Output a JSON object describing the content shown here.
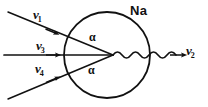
{
  "figure": {
    "kind": "physics-interaction-diagram",
    "background_color": "#ffffff",
    "ink_color": "#111111"
  },
  "atom": {
    "label": "Na",
    "shape": "circle",
    "center_x": 107,
    "center_y": 55,
    "radius": 43
  },
  "incoming_beams": [
    {
      "id": "nu1",
      "symbol": "ν",
      "subscript": "1",
      "direction": "down-right",
      "start": [
        8,
        12
      ],
      "end": [
        113,
        55
      ],
      "arrowhead_at": [
        52,
        33
      ]
    },
    {
      "id": "nu3",
      "symbol": "ν",
      "subscript": "3",
      "direction": "horizontal-right",
      "start": [
        4,
        55
      ],
      "end": [
        113,
        55
      ],
      "arrowhead_at": [
        56,
        55
      ]
    },
    {
      "id": "nu4",
      "symbol": "ν",
      "subscript": "4",
      "direction": "up-right",
      "start": [
        8,
        99
      ],
      "end": [
        113,
        55
      ],
      "arrowhead_at": [
        55,
        79
      ]
    }
  ],
  "outgoing_beam": {
    "id": "nu2",
    "symbol": "ν",
    "subscript": "2",
    "style": "wavy",
    "start": [
      113,
      55
    ],
    "end": [
      184,
      55
    ],
    "arrowhead_at": [
      184,
      55
    ]
  },
  "angles": [
    {
      "id": "alpha-top",
      "label": "α",
      "between": [
        "nu1",
        "nu3"
      ]
    },
    {
      "id": "alpha-bottom",
      "label": "α",
      "between": [
        "nu3",
        "nu4"
      ]
    }
  ],
  "vertex": {
    "x": 113,
    "y": 55
  }
}
